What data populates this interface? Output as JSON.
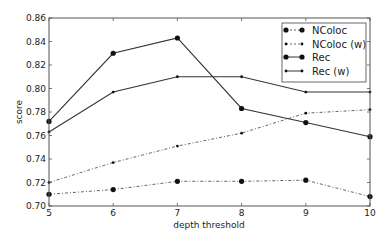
{
  "chart_data": {
    "type": "line",
    "title": "",
    "xlabel": "depth threshold",
    "ylabel": "score",
    "x": [
      5,
      6,
      7,
      8,
      9,
      10
    ],
    "xlim": [
      5,
      10
    ],
    "ylim": [
      0.7,
      0.86
    ],
    "xticks": [
      "5",
      "6",
      "7",
      "8",
      "9",
      "10"
    ],
    "yticks": [
      "0.70",
      "0.72",
      "0.74",
      "0.76",
      "0.78",
      "0.80",
      "0.82",
      "0.84",
      "0.86"
    ],
    "grid": false,
    "legend_position": "upper right",
    "series": [
      {
        "name": "NColoc",
        "style": "dashdot",
        "marker": "circle",
        "values": [
          0.71,
          0.714,
          0.721,
          0.721,
          0.722,
          0.708
        ]
      },
      {
        "name": "NColoc (w)",
        "style": "dashdot",
        "marker": "star",
        "values": [
          0.72,
          0.737,
          0.751,
          0.762,
          0.779,
          0.782
        ]
      },
      {
        "name": "Rec",
        "style": "solid",
        "marker": "circle",
        "values": [
          0.772,
          0.83,
          0.843,
          0.783,
          0.771,
          0.759
        ]
      },
      {
        "name": "Rec (w)",
        "style": "solid",
        "marker": "star",
        "values": [
          0.763,
          0.797,
          0.81,
          0.81,
          0.797,
          0.797
        ]
      }
    ]
  }
}
